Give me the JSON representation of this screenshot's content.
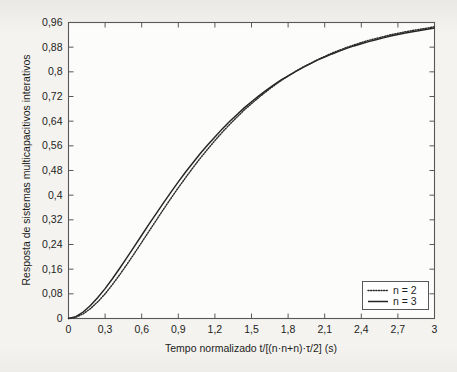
{
  "chart_data": {
    "type": "line",
    "title": "",
    "subtitle": "",
    "xlabel": "Tempo normalizado t/[(n·n+n)·τ/2]  (s)",
    "ylabel": "Resposta de sistemas multicapacitivos interativos",
    "xlim": [
      0,
      3
    ],
    "ylim": [
      0,
      0.96
    ],
    "grid": false,
    "legend_position": "lower-right",
    "xticks": [
      0,
      0.3,
      0.6,
      0.9,
      1.2,
      1.5,
      1.8,
      2.1,
      2.4,
      2.7,
      3
    ],
    "xtick_labels": [
      "0",
      "0,3",
      "0,6",
      "0,9",
      "1,2",
      "1,5",
      "1,8",
      "2,1",
      "2,4",
      "2,7",
      "3"
    ],
    "yticks": [
      0,
      0.08,
      0.16,
      0.24,
      0.32,
      0.4,
      0.48,
      0.56,
      0.64,
      0.72,
      0.8,
      0.88,
      0.96
    ],
    "ytick_labels": [
      "0",
      "0,08",
      "0,16",
      "0,24",
      "0,32",
      "0,4",
      "0,48",
      "0,56",
      "0,64",
      "0,72",
      "0,8",
      "0,88",
      "0,96"
    ],
    "x": [
      0,
      0.06,
      0.12,
      0.18,
      0.24,
      0.3,
      0.36,
      0.42,
      0.48,
      0.54,
      0.6,
      0.66,
      0.72,
      0.78,
      0.84,
      0.9,
      0.96,
      1.02,
      1.08,
      1.14,
      1.2,
      1.26,
      1.32,
      1.38,
      1.44,
      1.5,
      1.56,
      1.62,
      1.68,
      1.74,
      1.8,
      1.86,
      1.92,
      1.98,
      2.04,
      2.1,
      2.16,
      2.22,
      2.28,
      2.34,
      2.4,
      2.46,
      2.52,
      2.58,
      2.64,
      2.7,
      2.76,
      2.82,
      2.88,
      2.94,
      3
    ],
    "series": [
      {
        "name": "n = 2",
        "style": "dotted",
        "color": "#2b2b2b",
        "values": [
          0,
          0.004,
          0.015,
          0.032,
          0.054,
          0.08,
          0.11,
          0.142,
          0.176,
          0.211,
          0.247,
          0.283,
          0.319,
          0.355,
          0.39,
          0.424,
          0.457,
          0.489,
          0.52,
          0.549,
          0.577,
          0.604,
          0.629,
          0.653,
          0.676,
          0.697,
          0.717,
          0.736,
          0.754,
          0.771,
          0.786,
          0.801,
          0.815,
          0.827,
          0.839,
          0.85,
          0.861,
          0.87,
          0.879,
          0.887,
          0.895,
          0.902,
          0.908,
          0.914,
          0.92,
          0.925,
          0.93,
          0.934,
          0.938,
          0.942,
          0.946
        ]
      },
      {
        "name": "n = 3",
        "style": "solid",
        "color": "#252525",
        "values": [
          0,
          0.006,
          0.021,
          0.042,
          0.068,
          0.097,
          0.129,
          0.163,
          0.198,
          0.234,
          0.27,
          0.306,
          0.341,
          0.376,
          0.41,
          0.443,
          0.475,
          0.505,
          0.535,
          0.563,
          0.589,
          0.615,
          0.639,
          0.661,
          0.683,
          0.703,
          0.722,
          0.74,
          0.757,
          0.773,
          0.787,
          0.801,
          0.814,
          0.826,
          0.838,
          0.848,
          0.858,
          0.867,
          0.876,
          0.884,
          0.891,
          0.898,
          0.904,
          0.91,
          0.916,
          0.921,
          0.926,
          0.93,
          0.934,
          0.938,
          0.942
        ]
      }
    ],
    "legend": [
      {
        "label": "n = 2",
        "style": "dotted"
      },
      {
        "label": "n = 3",
        "style": "solid"
      }
    ]
  },
  "colors": {
    "page_background": "#f4f3f0",
    "plot_background": "#ffffff",
    "axis": "#58585a",
    "text": "#1d1d1b",
    "series_n2": "#2b2b2b",
    "series_n3": "#252525"
  }
}
